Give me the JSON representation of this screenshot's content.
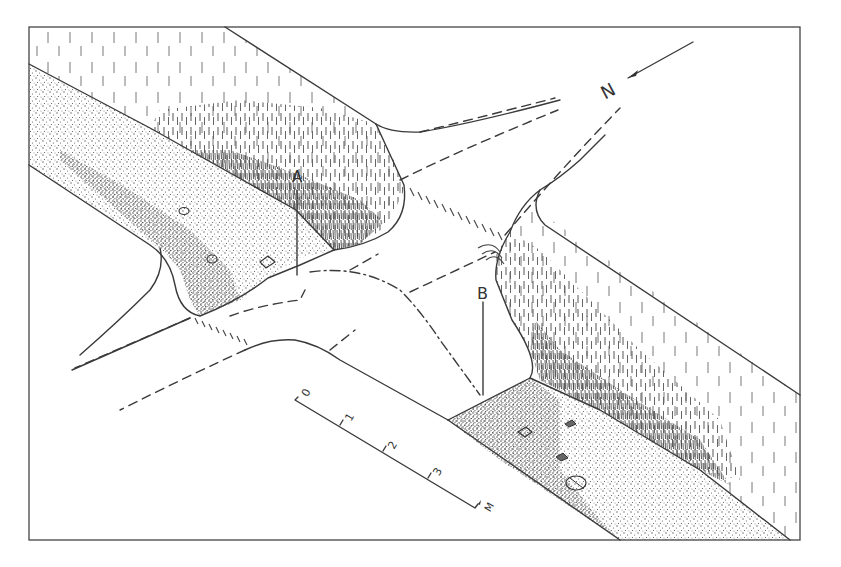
{
  "figure": {
    "type": "site plan line drawing",
    "frame": {
      "x": 29,
      "y": 27,
      "width": 771,
      "height": 513,
      "stroke": "#444444"
    },
    "labels": [
      {
        "id": "A",
        "text": "A",
        "x": 298,
        "y": 180
      },
      {
        "id": "B",
        "text": "B",
        "x": 484,
        "y": 298
      }
    ],
    "north_arrow": {
      "label": "N",
      "direction": "southwest"
    },
    "scale_bar": {
      "ticks": [
        "0",
        "1",
        "2",
        "3"
      ],
      "unit": "M"
    },
    "legend_hatching": {
      "grass_bank": "vertical hatching",
      "sand_gravel": "stipple with stones",
      "crossing": "short parallel hatch marks"
    },
    "colors": {
      "ink": "#3a3a3a",
      "background": "#ffffff"
    }
  }
}
